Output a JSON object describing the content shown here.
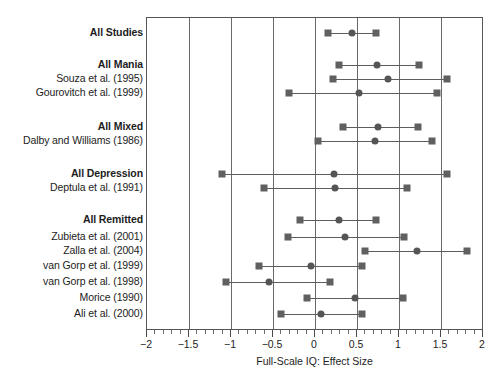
{
  "chart_data": {
    "type": "forest",
    "title": "",
    "xlabel": "Full-Scale IQ: Effect Size",
    "ylabel": "",
    "xlim": [
      -2,
      2
    ],
    "xticks": [
      -2,
      -1.5,
      -1,
      -0.5,
      0,
      0.5,
      1,
      1.5,
      2
    ],
    "xtick_labels": [
      "−2",
      "−1.5",
      "−1",
      "−0.5",
      "0",
      "0.5",
      "1",
      "1.5",
      "2"
    ],
    "minor_tick_step": 0.1,
    "grid": "vertical at every major tick",
    "legend": "none",
    "marker_color": "#606060",
    "point_estimate_marker": "circle",
    "ci_bound_marker": "square",
    "rows": [
      {
        "label": "All Studies",
        "summary": true,
        "effect": 0.44,
        "ci_low": 0.16,
        "ci_high": 0.73,
        "y": 32
      },
      {
        "label": "All Mania",
        "summary": true,
        "effect": 0.74,
        "ci_low": 0.28,
        "ci_high": 1.24,
        "y": 64
      },
      {
        "label": "Souza et al. (1995)",
        "summary": false,
        "effect": 0.87,
        "ci_low": 0.22,
        "ci_high": 1.57,
        "y": 78
      },
      {
        "label": "Gourovitch et al. (1999)",
        "summary": false,
        "effect": 0.52,
        "ci_low": -0.31,
        "ci_high": 1.45,
        "y": 92
      },
      {
        "label": "All Mixed",
        "summary": true,
        "effect": 0.75,
        "ci_low": 0.33,
        "ci_high": 1.23,
        "y": 126
      },
      {
        "label": "Dalby and Williams (1986)",
        "summary": false,
        "effect": 0.72,
        "ci_low": 0.04,
        "ci_high": 1.39,
        "y": 140
      },
      {
        "label": "All Depression",
        "summary": true,
        "effect": 0.23,
        "ci_low": -1.11,
        "ci_high": 1.57,
        "y": 173
      },
      {
        "label": "Deptula et al. (1991)",
        "summary": false,
        "effect": 0.24,
        "ci_low": -0.61,
        "ci_high": 1.1,
        "y": 187
      },
      {
        "label": "All Remitted",
        "summary": true,
        "effect": 0.28,
        "ci_low": -0.18,
        "ci_high": 0.73,
        "y": 219
      },
      {
        "label": "Zubieta et al. (2001)",
        "summary": false,
        "effect": 0.36,
        "ci_low": -0.32,
        "ci_high": 1.06,
        "y": 236
      },
      {
        "label": "Zalla et al. (2004)",
        "summary": false,
        "effect": 1.22,
        "ci_low": 0.59,
        "ci_high": 1.81,
        "y": 250
      },
      {
        "label": "van Gorp et al. (1999)",
        "summary": false,
        "effect": -0.05,
        "ci_low": -0.67,
        "ci_high": 0.56,
        "y": 265
      },
      {
        "label": "van Gorp et al. (1998)",
        "summary": false,
        "effect": -0.55,
        "ci_low": -1.06,
        "ci_high": 0.18,
        "y": 281
      },
      {
        "label": "Morice (1990)",
        "summary": false,
        "effect": 0.48,
        "ci_low": -0.1,
        "ci_high": 1.05,
        "y": 297
      },
      {
        "label": "Ali et al. (2000)",
        "summary": false,
        "effect": 0.07,
        "ci_low": -0.41,
        "ci_high": 0.56,
        "y": 313
      }
    ]
  }
}
